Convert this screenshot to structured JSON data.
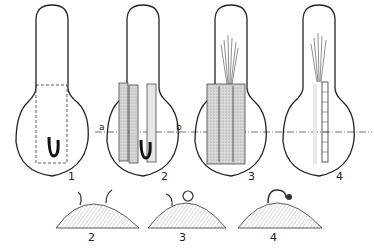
{
  "figure": {
    "top_row": {
      "panels": [
        {
          "id": "1",
          "label": "1",
          "center_x": 52
        },
        {
          "id": "2",
          "label": "2",
          "center_x": 143
        },
        {
          "id": "3",
          "label": "3",
          "center_x": 227
        },
        {
          "id": "4",
          "label": "4",
          "center_x": 311
        }
      ],
      "section_line": {
        "left_label": "a",
        "right_label": "b"
      }
    },
    "bottom_row": {
      "panels": [
        {
          "id": "2",
          "label": "2"
        },
        {
          "id": "3",
          "label": "3"
        },
        {
          "id": "4",
          "label": "4"
        }
      ]
    },
    "colors": {
      "ink": "#222222",
      "background": "#ffffff",
      "shade": "#bdbdbd"
    }
  }
}
